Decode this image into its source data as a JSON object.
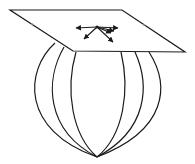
{
  "diagram": {
    "title": "",
    "colors": {
      "background": "#ffffff",
      "stroke": "#1a1a1a"
    },
    "plane": {
      "corners": [
        [
          10,
          10
        ],
        [
          122,
          10
        ],
        [
          185,
          52
        ],
        [
          73,
          51
        ]
      ]
    },
    "sphere": {
      "meridians": 6,
      "bottom_point": [
        97,
        157
      ]
    },
    "tangent_point": [
      97,
      27
    ],
    "vectors": [
      {
        "name": "vector-left",
        "to": [
          76,
          28
        ]
      },
      {
        "name": "vector-right",
        "to": [
          118,
          28
        ]
      },
      {
        "name": "vector-down-left",
        "to": [
          84,
          39
        ]
      },
      {
        "name": "vector-down-right-1",
        "to": [
          113,
          42
        ]
      },
      {
        "name": "vector-down-right-2",
        "to": [
          111,
          33
        ]
      },
      {
        "name": "vector-down-right-3",
        "to": [
          114,
          31
        ]
      }
    ]
  }
}
